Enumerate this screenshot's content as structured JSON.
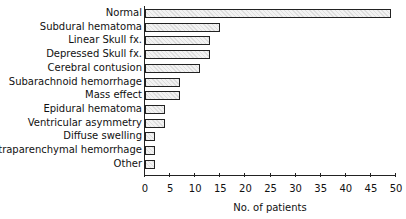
{
  "chart_data": {
    "type": "bar",
    "orientation": "horizontal",
    "title": "",
    "xlabel": "No. of patients",
    "ylabel": "",
    "xlim": [
      0,
      50
    ],
    "ticks": [
      "0",
      "5",
      "10",
      "15",
      "20",
      "25",
      "30",
      "35",
      "40",
      "45",
      "50"
    ],
    "grid": false,
    "categories": [
      "Normal",
      "Subdural hematoma",
      "Linear Skull fx.",
      "Depressed Skull fx.",
      "Cerebral contusion",
      "Subarachnoid hemorrhage",
      "Mass effect",
      "Epidural hematoma",
      "Ventricular asymmetry",
      "Diffuse swelling",
      "Intraparenchymal hemorrhage",
      "Other"
    ],
    "values": [
      49,
      15,
      13,
      13,
      11,
      7,
      7,
      4,
      4,
      2,
      2,
      2
    ]
  }
}
